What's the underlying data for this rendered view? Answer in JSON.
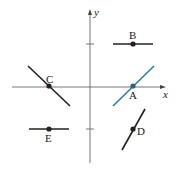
{
  "diagram": {
    "type": "slope-field-points",
    "axes": {
      "x_label": "x",
      "y_label": "y",
      "color": "#555555"
    },
    "points": [
      {
        "label": "A",
        "slope": "positive",
        "color": "#2f7f9a"
      },
      {
        "label": "B",
        "slope": "zero",
        "color": "#222222"
      },
      {
        "label": "C",
        "slope": "negative",
        "color": "#222222"
      },
      {
        "label": "D",
        "slope": "positive-steep",
        "color": "#222222"
      },
      {
        "label": "E",
        "slope": "zero",
        "color": "#222222"
      }
    ]
  }
}
